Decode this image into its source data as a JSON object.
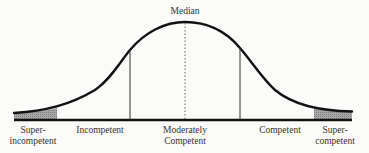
{
  "diagram": {
    "type": "normal-distribution-curve",
    "top_label": "Median",
    "categories": [
      {
        "id": "super-incompetent",
        "lines": [
          "Super-",
          "incompetent"
        ],
        "shaded": true
      },
      {
        "id": "incompetent",
        "lines": [
          "Incompetent"
        ],
        "shaded": false
      },
      {
        "id": "moderately-competent",
        "lines": [
          "Moderately",
          "Competent"
        ],
        "shaded": false
      },
      {
        "id": "competent",
        "lines": [
          "Competent"
        ],
        "shaded": false
      },
      {
        "id": "super-competent",
        "lines": [
          "Super-",
          "competent"
        ],
        "shaded": true
      }
    ],
    "colors": {
      "curve": "#111111",
      "baseline": "#111111",
      "shading": "#9a9a9a",
      "divider": "#333333",
      "background": "#fbfbf9"
    }
  }
}
